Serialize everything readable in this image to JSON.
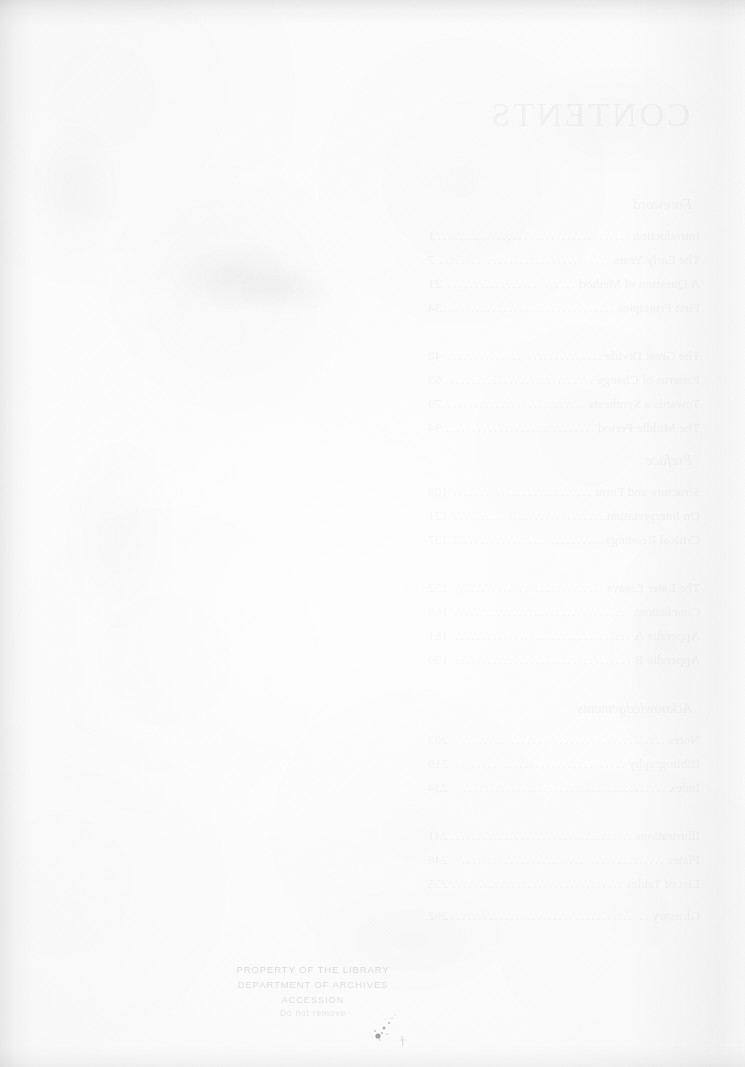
{
  "page": {
    "kind": "scanned-book-page",
    "side": "verso-blank",
    "paper_color": "#fdfdfd",
    "ink_color": "#4a4a52",
    "width_px": 745,
    "height_px": 1067
  },
  "bleed_through": {
    "note": "mirror-image show-through from the facing Contents page",
    "title": "CONTENTS",
    "sections": [
      {
        "label": "Foreword",
        "top": 196
      },
      {
        "label": "Preface",
        "top": 452
      },
      {
        "label": "Acknowledgements",
        "top": 700
      }
    ],
    "entries": [
      {
        "label": "Introduction",
        "page": "1",
        "top": 228
      },
      {
        "label": "The Early Years",
        "page": "7",
        "top": 252
      },
      {
        "label": "A Question of Method",
        "page": "21",
        "top": 276
      },
      {
        "label": "First Principles",
        "page": "34",
        "top": 300
      },
      {
        "label": "The Great Divide",
        "page": "48",
        "top": 348
      },
      {
        "label": "Patterns of Change",
        "page": "63",
        "top": 372
      },
      {
        "label": "Towards a Synthesis",
        "page": "79",
        "top": 396
      },
      {
        "label": "The Middle Period",
        "page": "94",
        "top": 420
      },
      {
        "label": "Structure and Form",
        "page": "108",
        "top": 484
      },
      {
        "label": "On Interpretation",
        "page": "121",
        "top": 508
      },
      {
        "label": "Critical Readings",
        "page": "137",
        "top": 532
      },
      {
        "label": "The Later Essays",
        "page": "152",
        "top": 580
      },
      {
        "label": "Conclusions",
        "page": "168",
        "top": 604
      },
      {
        "label": "Appendix A",
        "page": "181",
        "top": 628
      },
      {
        "label": "Appendix B",
        "page": "190",
        "top": 652
      },
      {
        "label": "Notes",
        "page": "203",
        "top": 732
      },
      {
        "label": "Bibliography",
        "page": "219",
        "top": 756
      },
      {
        "label": "Index",
        "page": "234",
        "top": 780
      },
      {
        "label": "Illustrations",
        "page": "241",
        "top": 828
      },
      {
        "label": "Plates",
        "page": "248",
        "top": 852
      },
      {
        "label": "List of Tables",
        "page": "255",
        "top": 876
      },
      {
        "label": "Glossary",
        "page": "262",
        "top": 908
      }
    ],
    "dot_leader": "......................................"
  },
  "stamp": {
    "lines": [
      "PROPERTY OF THE LIBRARY",
      "DEPARTMENT OF ARCHIVES",
      "ACCESSION",
      "Do not remove"
    ]
  },
  "marks": {
    "ink_blot_label": "ink-blot",
    "stains": [
      {
        "left": 168,
        "top": 244,
        "w": 140,
        "h": 64,
        "a": 0.035
      },
      {
        "left": 238,
        "top": 268,
        "w": 96,
        "h": 44,
        "a": 0.03
      },
      {
        "left": 60,
        "top": 430,
        "w": 120,
        "h": 210,
        "a": 0.016
      },
      {
        "left": 520,
        "top": 60,
        "w": 180,
        "h": 120,
        "a": 0.014
      },
      {
        "left": 300,
        "top": 880,
        "w": 220,
        "h": 120,
        "a": 0.012
      },
      {
        "left": 600,
        "top": 520,
        "w": 130,
        "h": 260,
        "a": 0.013
      },
      {
        "left": 30,
        "top": 120,
        "w": 90,
        "h": 140,
        "a": 0.018
      }
    ]
  }
}
